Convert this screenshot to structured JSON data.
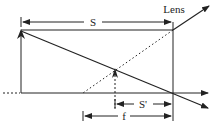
{
  "diagram": {
    "labels": {
      "lens": "Lens",
      "object_distance": "S",
      "image_distance": "S'",
      "focal_length": "f"
    },
    "colors": {
      "line": "#222222",
      "background": "#ffffff"
    }
  }
}
